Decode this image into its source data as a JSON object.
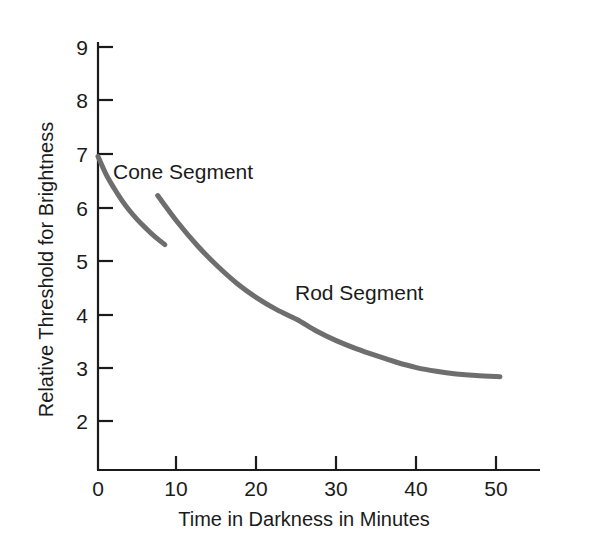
{
  "chart_data": {
    "type": "line",
    "title": "",
    "subtitle": "",
    "xlabel": "Time in Darkness in Minutes",
    "ylabel": "Relative Threshold for Brightness",
    "xlim": [
      0,
      55
    ],
    "ylim": [
      1.1,
      9
    ],
    "grid": false,
    "legend_position": "inline-annotations",
    "xticks": [
      {
        "value": 0,
        "label": "0"
      },
      {
        "value": 10,
        "label": "10"
      },
      {
        "value": 20,
        "label": "20"
      },
      {
        "value": 30,
        "label": "30"
      },
      {
        "value": 40,
        "label": "40"
      },
      {
        "value": 50,
        "label": "50"
      }
    ],
    "yticks": [
      {
        "value": 2,
        "label": "2"
      },
      {
        "value": 3,
        "label": "3"
      },
      {
        "value": 4,
        "label": "4"
      },
      {
        "value": 5,
        "label": "5"
      },
      {
        "value": 6,
        "label": "6"
      },
      {
        "value": 7,
        "label": "7"
      },
      {
        "value": 8,
        "label": "8"
      },
      {
        "value": 9,
        "label": "9"
      }
    ],
    "line_color": "#6e6e6e",
    "axis_color": "#1b1b1b",
    "series": [
      {
        "name": "Cone Segment",
        "annotation": "Cone Segment",
        "color": "#6e6e6e",
        "points": [
          {
            "x": 0.0,
            "y": 6.95
          },
          {
            "x": 1.0,
            "y": 6.62
          },
          {
            "x": 2.0,
            "y": 6.36
          },
          {
            "x": 3.0,
            "y": 6.13
          },
          {
            "x": 4.0,
            "y": 5.93
          },
          {
            "x": 5.0,
            "y": 5.76
          },
          {
            "x": 6.0,
            "y": 5.61
          },
          {
            "x": 7.0,
            "y": 5.47
          },
          {
            "x": 8.4,
            "y": 5.3
          }
        ]
      },
      {
        "name": "Rod Segment",
        "annotation": "Rod Segment",
        "color": "#6e6e6e",
        "points": [
          {
            "x": 7.5,
            "y": 6.22
          },
          {
            "x": 10.0,
            "y": 5.72
          },
          {
            "x": 12.5,
            "y": 5.28
          },
          {
            "x": 15.0,
            "y": 4.9
          },
          {
            "x": 17.5,
            "y": 4.57
          },
          {
            "x": 20.0,
            "y": 4.3
          },
          {
            "x": 22.5,
            "y": 4.08
          },
          {
            "x": 25.0,
            "y": 3.9
          },
          {
            "x": 27.5,
            "y": 3.68
          },
          {
            "x": 30.0,
            "y": 3.5
          },
          {
            "x": 32.5,
            "y": 3.35
          },
          {
            "x": 35.0,
            "y": 3.22
          },
          {
            "x": 37.5,
            "y": 3.1
          },
          {
            "x": 40.0,
            "y": 3.0
          },
          {
            "x": 42.5,
            "y": 2.93
          },
          {
            "x": 45.0,
            "y": 2.88
          },
          {
            "x": 47.5,
            "y": 2.85
          },
          {
            "x": 50.5,
            "y": 2.83
          }
        ]
      }
    ]
  },
  "axes": {
    "y_title": "Relative Threshold for Brightness",
    "x_title": "Time in Darkness in Minutes",
    "ytick_labels": [
      "9",
      "8",
      "7",
      "6",
      "5",
      "4",
      "3",
      "2"
    ],
    "xtick_labels": [
      "0",
      "10",
      "20",
      "30",
      "40",
      "50"
    ]
  },
  "annotations": {
    "cone": "Cone Segment",
    "rod": "Rod Segment"
  }
}
